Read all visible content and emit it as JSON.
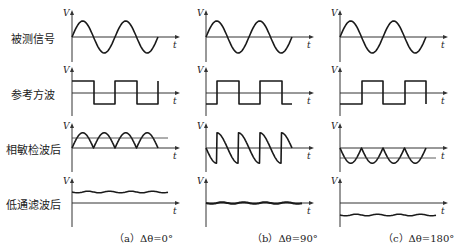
{
  "figure": {
    "row_labels": [
      "被测信号",
      "参考方波",
      "相敏检波后",
      "低通滤波后"
    ],
    "axis_labels": {
      "y": "V",
      "x": "t"
    },
    "captions": [
      "（a）Δθ=0°",
      "（b）Δθ=90°",
      "（c）Δθ=180°"
    ],
    "columns": [
      {
        "phase_deg": 0,
        "lowpass_level": "positive"
      },
      {
        "phase_deg": 90,
        "lowpass_level": "zero"
      },
      {
        "phase_deg": 180,
        "lowpass_level": "negative"
      }
    ],
    "colors": {
      "line": "#1a1a1a",
      "axis": "#333333",
      "background": "#ffffff"
    }
  }
}
